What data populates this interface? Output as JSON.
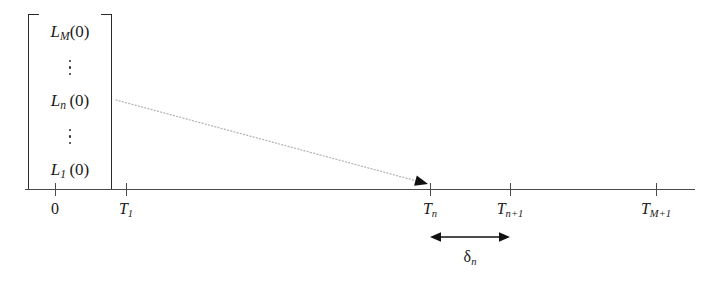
{
  "figure": {
    "background_color": "#ffffff",
    "line_color": "#4a4a4a",
    "text_color": "#1a1a1a",
    "dotted_arrow_color": "#b0b0b0"
  },
  "vector": {
    "name": "initial-lengths-vector",
    "entries": [
      {
        "kind": "term",
        "base": "L",
        "subscript": "M",
        "argument": "(0)",
        "text": "L"
      },
      {
        "kind": "vdots",
        "text": "⋮"
      },
      {
        "kind": "term",
        "base": "L",
        "subscript": "n",
        "argument": "(0)",
        "text": "L"
      },
      {
        "kind": "vdots",
        "text": "⋮"
      },
      {
        "kind": "term",
        "base": "L",
        "subscript": "1",
        "argument": "(0)",
        "text": "L"
      }
    ]
  },
  "axis": {
    "name": "time-axis",
    "ticks": [
      {
        "label_base": "0",
        "subscript": "",
        "upright": true,
        "x": 55
      },
      {
        "label_base": "T",
        "subscript": "1",
        "upright": false,
        "x": 126
      },
      {
        "label_base": "T",
        "subscript": "n",
        "upright": false,
        "x": 430
      },
      {
        "label_base": "T",
        "subscript": "n+1",
        "upright": false,
        "x": 510
      },
      {
        "label_base": "T",
        "subscript": "M+1",
        "upright": false,
        "x": 656
      }
    ]
  },
  "pointer": {
    "name": "dotted-mapping-arrow",
    "from_x": 116,
    "from_y": 100,
    "to_x": 428,
    "to_y": 184,
    "style": "dotted"
  },
  "interval": {
    "name": "delta-n-interval",
    "symbol": "δ",
    "subscript": "n",
    "start_x": 430,
    "end_x": 510
  }
}
